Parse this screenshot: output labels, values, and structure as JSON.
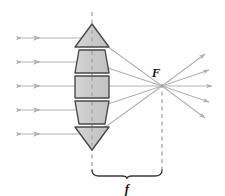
{
  "figure": {
    "background_color": "#ffffff"
  },
  "labels": {
    "focal_point": "F",
    "focal_length": "f"
  },
  "colors": {
    "prism_fill": "#c9c9c9",
    "prism_fill_light": "#d4d4d4",
    "prism_stroke": "#4a4a4a",
    "ray_color": "#b3b3b3",
    "axis_dash_color": "#8c8c8c",
    "bracket_color": "#3c3c3c",
    "label_color": "#1a1a1a"
  },
  "geometry": {
    "optical_axis_x": 92,
    "focal_point_x": 162,
    "focal_point_y": 86,
    "lens_left_x": 75,
    "lens_right_x": 109,
    "lens_top_y": 24,
    "lens_bottom_y": 150
  },
  "prisms": [
    {
      "name": "prism-top-triangle",
      "shape": "triangle",
      "points": "92,24 109,47 75,47"
    },
    {
      "name": "prism-upper-trapezoid",
      "shape": "trapezoid",
      "points": "79,50 105,50 109,73 75,73"
    },
    {
      "name": "prism-center-rectangle",
      "shape": "rectangle",
      "points": "75,76 109,76 109,98 75,98"
    },
    {
      "name": "prism-lower-trapezoid",
      "shape": "trapezoid",
      "points": "75,101 109,101 105,124 79,124"
    },
    {
      "name": "prism-bottom-triangle",
      "shape": "triangle",
      "points": "75,127 109,127 92,150"
    }
  ],
  "incoming_rays": [
    {
      "name": "incoming-ray-1",
      "y": 38,
      "x_start": 22,
      "x_end": 84
    },
    {
      "name": "incoming-ray-2",
      "y": 62,
      "x_start": 22,
      "x_end": 80
    },
    {
      "name": "incoming-ray-3",
      "y": 86,
      "x_start": 22,
      "x_end": 77
    },
    {
      "name": "incoming-ray-4",
      "y": 110,
      "x_start": 22,
      "x_end": 80
    },
    {
      "name": "incoming-ray-5",
      "y": 134,
      "x_start": 22,
      "x_end": 84
    }
  ],
  "refracted_rays": [
    {
      "name": "refracted-ray-1",
      "x1": 104,
      "y1": 44,
      "x2": 162,
      "y2": 86
    },
    {
      "name": "refracted-ray-2",
      "x1": 108,
      "y1": 68,
      "x2": 162,
      "y2": 86
    },
    {
      "name": "refracted-ray-3",
      "x1": 109,
      "y1": 86,
      "x2": 162,
      "y2": 86
    },
    {
      "name": "refracted-ray-4",
      "x1": 108,
      "y1": 104,
      "x2": 162,
      "y2": 86
    },
    {
      "name": "refracted-ray-5",
      "x1": 104,
      "y1": 128,
      "x2": 162,
      "y2": 86
    }
  ],
  "outgoing_rays": [
    {
      "name": "outgoing-ray-1",
      "x1": 162,
      "y1": 86,
      "x2": 205,
      "y2": 54
    },
    {
      "name": "outgoing-ray-2",
      "x1": 162,
      "y1": 86,
      "x2": 211,
      "y2": 70
    },
    {
      "name": "outgoing-ray-3",
      "x1": 162,
      "y1": 86,
      "x2": 214,
      "y2": 86
    },
    {
      "name": "outgoing-ray-4",
      "x1": 162,
      "y1": 86,
      "x2": 211,
      "y2": 102
    },
    {
      "name": "outgoing-ray-5",
      "x1": 162,
      "y1": 86,
      "x2": 205,
      "y2": 118
    }
  ],
  "dashed_lines": [
    {
      "name": "lens-axis-dashed-line",
      "x": 92,
      "y1": 12,
      "y2": 172
    },
    {
      "name": "focal-point-dashed-line",
      "x": 162,
      "y1": 84,
      "y2": 172
    }
  ],
  "bracket": {
    "name": "focal-length-bracket",
    "x_left": 92,
    "x_right": 162,
    "y": 176,
    "label_x": 127,
    "label_y": 192
  },
  "focal_label_position": {
    "x": 156,
    "y": 76
  }
}
